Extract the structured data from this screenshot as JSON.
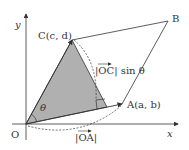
{
  "diagram": {
    "axes": {
      "x_label": "x",
      "y_label": "y",
      "origin_label": "O"
    },
    "points": {
      "A": "A(a, b)",
      "B": "B",
      "C": "C(c, d)"
    },
    "angle_label": "θ",
    "annotations": {
      "oc_sin": "|OC| sin θ",
      "oc_vec": "OC",
      "oa": "OA"
    },
    "colors": {
      "shade": "#b0b0b0",
      "line": "#333333"
    }
  }
}
